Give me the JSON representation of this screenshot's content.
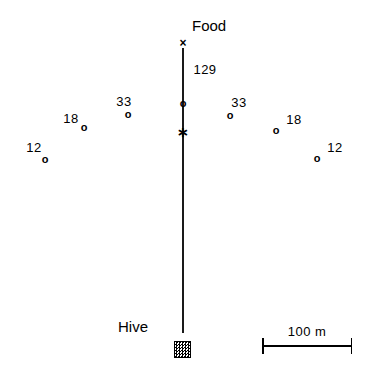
{
  "figure": {
    "width": 376,
    "height": 377,
    "background": "#ffffff",
    "ink_color": "#000000"
  },
  "labels": {
    "food": "Food",
    "hive": "Hive",
    "food_count": "129",
    "scale": "100  m"
  },
  "axis": {
    "x": 183,
    "top_y": 48,
    "bottom_y": 333,
    "color": "#1a1a1a"
  },
  "markers": [
    {
      "name": "food-site-marker",
      "glyph": "×",
      "shape": "x",
      "x": 183,
      "y": 43,
      "count": null
    },
    {
      "name": "center-circle-marker",
      "glyph": "o",
      "shape": "circle",
      "x": 183,
      "y": 103,
      "count": "129"
    },
    {
      "name": "dance-site-marker",
      "glyph": "∗",
      "shape": "star",
      "x": 183,
      "y": 132,
      "count": null
    },
    {
      "name": "recruit-marker-left-12",
      "glyph": "o",
      "shape": "circle",
      "x": 45,
      "y": 159,
      "count": "12"
    },
    {
      "name": "recruit-marker-left-18",
      "glyph": "o",
      "shape": "circle",
      "x": 84,
      "y": 127,
      "count": "18"
    },
    {
      "name": "recruit-marker-left-33",
      "glyph": "o",
      "shape": "circle",
      "x": 128,
      "y": 114,
      "count": "33"
    },
    {
      "name": "recruit-marker-right-33",
      "glyph": "o",
      "shape": "circle",
      "x": 230,
      "y": 115,
      "count": "33"
    },
    {
      "name": "recruit-marker-right-18",
      "glyph": "o",
      "shape": "circle",
      "x": 276,
      "y": 130,
      "count": "18"
    },
    {
      "name": "recruit-marker-right-12",
      "glyph": "o",
      "shape": "circle",
      "x": 317,
      "y": 158,
      "count": "12"
    }
  ],
  "counts": [
    {
      "name": "count-label-food",
      "text": "129",
      "x": 205,
      "y": 63
    },
    {
      "name": "count-label-left-12",
      "text": "12",
      "x": 34,
      "y": 141
    },
    {
      "name": "count-label-left-18",
      "text": "18",
      "x": 71,
      "y": 112
    },
    {
      "name": "count-label-left-33",
      "text": "33",
      "x": 124,
      "y": 95
    },
    {
      "name": "count-label-right-33",
      "text": "33",
      "x": 239,
      "y": 96
    },
    {
      "name": "count-label-right-18",
      "text": "18",
      "x": 294,
      "y": 113
    },
    {
      "name": "count-label-right-12",
      "text": "12",
      "x": 335,
      "y": 141
    }
  ],
  "food_label_pos": {
    "x": 192,
    "y": 18
  },
  "hive_label_pos": {
    "x": 118,
    "y": 319
  },
  "hive_box": {
    "x": 174,
    "y": 341,
    "size": 17
  },
  "scale_bar": {
    "x": 262,
    "y": 333,
    "width": 90
  }
}
